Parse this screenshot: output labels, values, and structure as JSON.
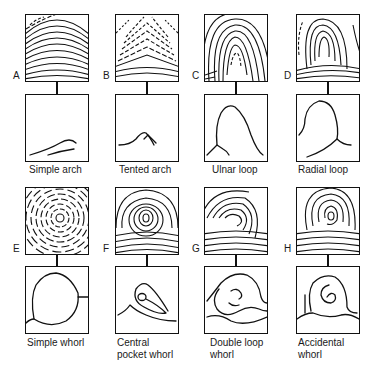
{
  "figure": {
    "panels": [
      {
        "letter": "A",
        "caption": "Simple arch",
        "caption_lines": [
          "Simple arch"
        ],
        "pattern": "simple-arch"
      },
      {
        "letter": "B",
        "caption": "Tented arch",
        "caption_lines": [
          "Tented arch"
        ],
        "pattern": "tented-arch"
      },
      {
        "letter": "C",
        "caption": "Ulnar loop",
        "caption_lines": [
          "Ulnar loop"
        ],
        "pattern": "ulnar-loop"
      },
      {
        "letter": "D",
        "caption": "Radial loop",
        "caption_lines": [
          "Radial loop"
        ],
        "pattern": "radial-loop"
      },
      {
        "letter": "E",
        "caption": "Simple whorl",
        "caption_lines": [
          "Simple whorl"
        ],
        "pattern": "simple-whorl"
      },
      {
        "letter": "F",
        "caption": "Central pocket whorl",
        "caption_lines": [
          "Central",
          "pocket whorl"
        ],
        "pattern": "central-pocket-whorl"
      },
      {
        "letter": "G",
        "caption": "Double loop whorl",
        "caption_lines": [
          "Double loop",
          "whorl"
        ],
        "pattern": "double-loop-whorl"
      },
      {
        "letter": "H",
        "caption": "Accidental whorl",
        "caption_lines": [
          "Accidental",
          "whorl"
        ],
        "pattern": "accidental-whorl"
      }
    ]
  },
  "colors": {
    "line": "#111111",
    "background": "#ffffff"
  }
}
